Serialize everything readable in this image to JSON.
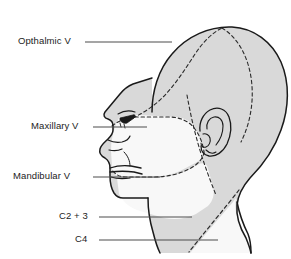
{
  "figure": {
    "type": "anatomical-diagram",
    "width": 291,
    "height": 259,
    "background_color": "#ffffff"
  },
  "colors": {
    "outline": "#1a1a1a",
    "shaded_region": "#d9d9d9",
    "unshaded_region": "#f7f7f7",
    "dashed_boundary": "#2b2b2b",
    "leader_line": "#4d4d4d",
    "label_text": "#1c1c1c"
  },
  "labels": [
    {
      "id": "ophthalmic",
      "text": "Opthalmic V"
    },
    {
      "id": "maxillary",
      "text": "Maxillary V"
    },
    {
      "id": "mandibular",
      "text": "Mandibular V"
    },
    {
      "id": "c23",
      "text": "C2 + 3"
    },
    {
      "id": "c4",
      "text": "C4"
    }
  ],
  "regions": [
    {
      "id": "ophthalmic-region",
      "name": "Ophthalmic division territory",
      "fill": "shaded"
    },
    {
      "id": "maxillary-region",
      "name": "Maxillary division territory",
      "fill": "unshaded"
    },
    {
      "id": "mandibular-region",
      "name": "Mandibular division territory",
      "fill": "unshaded"
    },
    {
      "id": "c23-region",
      "name": "C2 and C3 dermatome",
      "fill": "shaded"
    },
    {
      "id": "c4-region",
      "name": "C4 dermatome",
      "fill": "unshaded"
    }
  ],
  "anatomy_features": [
    {
      "id": "cranium",
      "name": "cranium outline"
    },
    {
      "id": "eye",
      "name": "eye"
    },
    {
      "id": "nose",
      "name": "nose"
    },
    {
      "id": "lips",
      "name": "lips"
    },
    {
      "id": "ear",
      "name": "ear"
    },
    {
      "id": "jawline",
      "name": "jawline"
    },
    {
      "id": "neck",
      "name": "neck"
    }
  ]
}
